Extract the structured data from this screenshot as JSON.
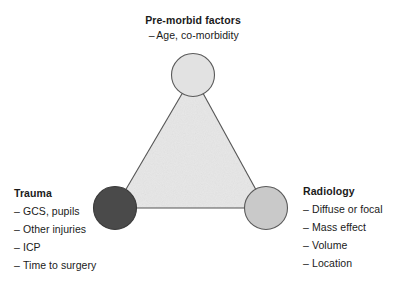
{
  "figure": {
    "width": 397,
    "height": 286,
    "background": "#ffffff",
    "type": "triangle-relationship-diagram"
  },
  "colors": {
    "text": "#1a1a1a",
    "outline": "#555555",
    "triangle_fill": "#efefef",
    "node_premorbid_fill": "#e2e2e2",
    "node_trauma_fill": "#4a4a4a",
    "node_radiology_fill": "#c9c9c9"
  },
  "nodes": {
    "premorbid": {
      "title": "Pre-morbid factors",
      "items": [
        "Age, co-morbidity"
      ],
      "cx": 193,
      "cy": 75,
      "r": 22,
      "fill": "#e2e2e2"
    },
    "trauma": {
      "title": "Trauma",
      "items": [
        "GCS, pupils",
        "Other injuries",
        "ICP",
        "Time to surgery"
      ],
      "cx": 115,
      "cy": 208,
      "r": 22,
      "fill": "#4a4a4a"
    },
    "radiology": {
      "title": "Radiology",
      "items": [
        "Diffuse or focal",
        "Mass effect",
        "Volume",
        "Location"
      ],
      "cx": 266,
      "cy": 208,
      "r": 22,
      "fill": "#c9c9c9"
    }
  },
  "bullet_marker": "–"
}
